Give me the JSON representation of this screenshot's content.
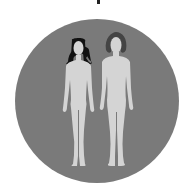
{
  "illustration": {
    "subject": "Two standing human figures (woman and man) inside a circle",
    "figures": [
      {
        "name": "woman",
        "hair": "long black straight hair"
      },
      {
        "name": "man",
        "hair": "shoulder-length dark hair"
      }
    ],
    "colors": {
      "background": "#ffffff",
      "circle": "#7a7a7a",
      "figure": "#d4d4d4",
      "hair_woman": "#111111",
      "hair_man": "#444444",
      "top_mark": "#222222"
    }
  }
}
